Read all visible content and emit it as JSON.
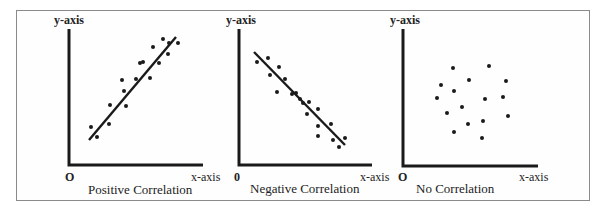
{
  "figure": {
    "panels": [
      {
        "title": "Positive Correlation",
        "y_label": "y-axis",
        "x_label": "x-axis",
        "origin_label": "O",
        "trend": "positive"
      },
      {
        "title": "Negative Correlation",
        "y_label": "y-axis",
        "x_label": "x-axis",
        "origin_label": "0",
        "trend": "negative"
      },
      {
        "title": "No Correlation",
        "y_label": "y-axis",
        "x_label": "x-axis",
        "origin_label": "O",
        "trend": "none"
      }
    ]
  },
  "colors": {
    "ink": "#1a1a1a",
    "frame": "#8a8a8a",
    "background": "#ffffff"
  },
  "chart_data": [
    {
      "type": "scatter",
      "title": "Positive Correlation",
      "xlabel": "x-axis",
      "ylabel": "y-axis",
      "trendline": {
        "from": [
          89,
          140
        ],
        "to": [
          176,
          37
        ]
      },
      "points": [
        [
          91,
          127
        ],
        [
          97,
          137
        ],
        [
          110,
          105
        ],
        [
          109,
          124
        ],
        [
          122,
          80
        ],
        [
          124,
          91
        ],
        [
          126,
          106
        ],
        [
          140,
          63
        ],
        [
          150,
          78
        ],
        [
          136,
          79
        ],
        [
          153,
          47
        ],
        [
          163,
          39
        ],
        [
          169,
          43
        ],
        [
          178,
          43
        ],
        [
          168,
          54
        ],
        [
          159,
          63
        ],
        [
          143,
          62
        ]
      ]
    },
    {
      "type": "scatter",
      "title": "Negative Correlation",
      "xlabel": "x-axis",
      "ylabel": "y-axis",
      "trendline": {
        "from": [
          254,
          52
        ],
        "to": [
          345,
          145
        ]
      },
      "points": [
        [
          257,
          62
        ],
        [
          268,
          58
        ],
        [
          270,
          75
        ],
        [
          279,
          67
        ],
        [
          285,
          79
        ],
        [
          277,
          92
        ],
        [
          292,
          94
        ],
        [
          296,
          93
        ],
        [
          300,
          99
        ],
        [
          303,
          103
        ],
        [
          309,
          102
        ],
        [
          307,
          114
        ],
        [
          318,
          109
        ],
        [
          318,
          126
        ],
        [
          318,
          136
        ],
        [
          331,
          124
        ],
        [
          333,
          140
        ],
        [
          339,
          147
        ],
        [
          345,
          138
        ]
      ]
    },
    {
      "type": "scatter",
      "title": "No Correlation",
      "xlabel": "x-axis",
      "ylabel": "y-axis",
      "trendline": null,
      "points": [
        [
          453,
          68
        ],
        [
          489,
          66
        ],
        [
          441,
          85
        ],
        [
          469,
          80
        ],
        [
          506,
          81
        ],
        [
          454,
          91
        ],
        [
          437,
          98
        ],
        [
          485,
          99
        ],
        [
          503,
          97
        ],
        [
          447,
          113
        ],
        [
          462,
          107
        ],
        [
          508,
          116
        ],
        [
          483,
          121
        ],
        [
          468,
          124
        ],
        [
          454,
          132
        ],
        [
          482,
          138
        ]
      ]
    }
  ]
}
